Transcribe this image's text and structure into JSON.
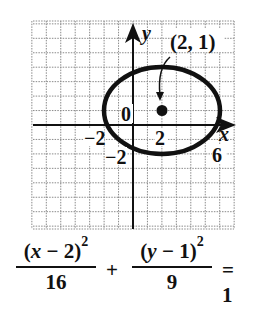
{
  "chart_data": {
    "type": "line",
    "title": "",
    "xlabel": "x",
    "ylabel": "y",
    "xlim": [
      -7,
      7
    ],
    "ylim": [
      -7.2,
      7.2
    ],
    "grid": true,
    "unit_per_gridline": 1,
    "tick_labels": {
      "x": [
        {
          "value": -2,
          "label": "−2"
        },
        {
          "value": 2,
          "label": "2"
        },
        {
          "value": 6,
          "label": "6"
        }
      ],
      "y": [
        {
          "value": -2,
          "label": "−2"
        }
      ],
      "origin": "0"
    },
    "series": [
      {
        "name": "ellipse",
        "kind": "ellipse",
        "center": [
          2,
          1
        ],
        "semi_axis_x": 4,
        "semi_axis_y": 3,
        "x_extent": [
          -2,
          6
        ],
        "y_extent": [
          -2,
          4
        ]
      }
    ],
    "points": [
      {
        "x": 2,
        "y": 1,
        "label": "(2, 1)",
        "note": "center"
      }
    ],
    "annotations": [
      {
        "text": "(2, 1)",
        "points_to": [
          2,
          1
        ]
      }
    ],
    "equation": "(x − 2)^2/16 + (y − 1)^2/9 = 1"
  },
  "labels": {
    "x_axis": "x",
    "y_axis": "y",
    "origin": "0",
    "tick_neg2_x": "−2",
    "tick_2_x": "2",
    "tick_6_x": "6",
    "tick_neg2_y": "−2",
    "center_label": "(2, 1)"
  },
  "equation": {
    "term1_num_open": "(",
    "term1_var": "x",
    "term1_rest": " − 2)",
    "term1_exp": "2",
    "term1_den": "16",
    "plus": "+",
    "term2_num_open": "(",
    "term2_var": "y",
    "term2_rest": " − 1)",
    "term2_exp": "2",
    "term2_den": "9",
    "rhs": "= 1"
  }
}
